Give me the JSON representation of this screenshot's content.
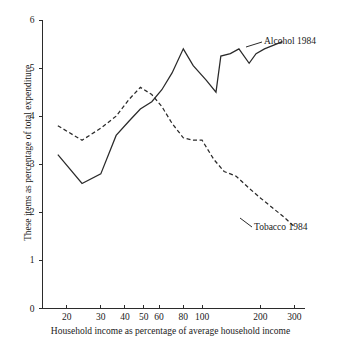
{
  "chart_data": {
    "type": "line",
    "title": "",
    "xlabel": "Household income as percentage of average household income",
    "ylabel": "These items as percentage of total expenditure",
    "xscale": "log",
    "xlim": [
      15,
      340
    ],
    "ylim": [
      0,
      6
    ],
    "grid": false,
    "legend_position": "inline-right-annotations",
    "xticks": [
      20,
      30,
      40,
      50,
      60,
      80,
      100,
      200,
      300
    ],
    "xtick_labels": [
      "20",
      "30",
      "40",
      "50",
      "60",
      "80",
      "100",
      "200",
      "300"
    ],
    "yticks": [
      0,
      1,
      2,
      3,
      4,
      5,
      6
    ],
    "ytick_labels": [
      "0",
      "1",
      "2",
      "3",
      "4",
      "5",
      "6"
    ],
    "series": [
      {
        "name": "Alcohol 1984",
        "style": "solid",
        "annotation": "Alcohol 1984",
        "x": [
          18,
          24,
          30,
          36,
          42,
          48,
          55,
          62,
          70,
          80,
          90,
          105,
          118,
          125,
          140,
          155,
          175,
          190,
          210,
          260
        ],
        "values": [
          3.2,
          2.6,
          2.8,
          3.6,
          3.9,
          4.15,
          4.3,
          4.55,
          4.9,
          5.4,
          5.05,
          4.75,
          4.5,
          5.25,
          5.3,
          5.4,
          5.1,
          5.3,
          5.4,
          5.55
        ]
      },
      {
        "name": "Tobacco 1984",
        "style": "dashed",
        "annotation": "Tobacco 1984",
        "x": [
          18,
          24,
          30,
          36,
          42,
          48,
          55,
          62,
          70,
          80,
          90,
          100,
          115,
          130,
          150,
          175,
          200,
          230,
          265,
          300
        ],
        "values": [
          3.8,
          3.5,
          3.75,
          4.0,
          4.35,
          4.6,
          4.45,
          4.2,
          3.85,
          3.55,
          3.5,
          3.5,
          3.1,
          2.85,
          2.75,
          2.5,
          2.3,
          2.1,
          1.9,
          1.7
        ]
      }
    ],
    "annotations": [
      {
        "text": "Alcohol 1984",
        "target_x": 260,
        "target_y": 5.55
      },
      {
        "text": "Tobacco 1984",
        "target_x": 300,
        "target_y": 1.7
      }
    ]
  }
}
